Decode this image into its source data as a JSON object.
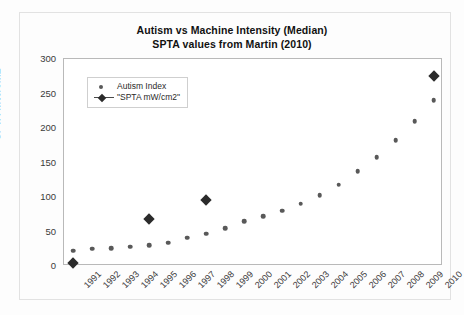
{
  "chart_data": {
    "type": "scatter",
    "title": "Autism vs Machine Intensity (Median)",
    "subtitle": "SPTA values from Martin (2010)",
    "xlabel": "",
    "ylabel": "SPTA mW/cm2",
    "ylim": [
      0,
      300
    ],
    "yticks": [
      0,
      50,
      100,
      150,
      200,
      250,
      300
    ],
    "grid": false,
    "legend_position": "upper left",
    "categories": [
      "1991",
      "1992",
      "1993",
      "1994",
      "1995",
      "1996",
      "1997",
      "1998",
      "1999",
      "2000",
      "2001",
      "2002",
      "2003",
      "2004",
      "2005",
      "2006",
      "2007",
      "2008",
      "2009",
      "2010"
    ],
    "series": [
      {
        "name": "Autism Index",
        "marker": "circle",
        "color": "#595959",
        "values": [
          22,
          25,
          26,
          28,
          30,
          34,
          41,
          47,
          55,
          65,
          72,
          80,
          90,
          103,
          118,
          137,
          158,
          182,
          210,
          240
        ]
      },
      {
        "name": "\"SPTA mW/cm2\"",
        "marker": "diamond",
        "color": "#2b2b2b",
        "x": [
          "1991",
          "1995",
          "1998",
          "2010"
        ],
        "values": [
          5,
          68,
          96,
          275
        ]
      }
    ]
  },
  "legend": {
    "items": [
      {
        "label": "Autism Index"
      },
      {
        "label": "\"SPTA mW/cm2\""
      }
    ]
  }
}
